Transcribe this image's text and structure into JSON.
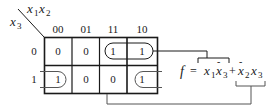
{
  "kmap": {
    "row_var": "x3",
    "col_vars": "x1x2",
    "col_headers": [
      "00",
      "01",
      "11",
      "10"
    ],
    "row_headers": [
      "0",
      "1"
    ],
    "cells": [
      [
        "0",
        "0",
        "1",
        "1"
      ],
      [
        "1",
        "0",
        "0",
        "1"
      ]
    ]
  },
  "equation": {
    "lhs": "f",
    "eq": "=",
    "term1": "x1 x̄3",
    "plus": "+",
    "term2": "x̄2 x3"
  },
  "labels": {
    "x": "x",
    "sub1": "1",
    "sub2": "2",
    "sub3": "3"
  },
  "colors": {
    "ink": "#1a1a1a",
    "grid": "#1a1a1a",
    "bracket": "#555555"
  }
}
